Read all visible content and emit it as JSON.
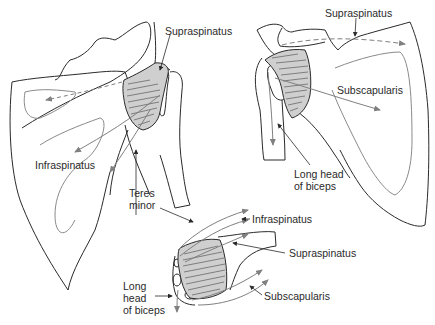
{
  "figure": {
    "views": [
      {
        "id": "posterior-view",
        "description": "Posterior view of scapula with rotator cuff"
      },
      {
        "id": "anterior-view",
        "description": "Anterior view of scapula with rotator cuff"
      },
      {
        "id": "superior-view",
        "description": "Superior view of humeral head with rotator cuff"
      }
    ],
    "colors": {
      "outline": "#2a2a2a",
      "muscle_fill": "#cfcfcf",
      "arrow": "#808080",
      "background": "#ffffff"
    }
  },
  "labels": {
    "posterior": {
      "supraspinatus": "Supraspinatus",
      "infraspinatus": "Infraspinatus",
      "teres_minor": "Teres\nminor"
    },
    "anterior": {
      "supraspinatus": "Supraspinatus",
      "subscapularis": "Subscapularis",
      "long_head_biceps": "Long head\nof biceps"
    },
    "superior": {
      "infraspinatus": "Infraspinatus",
      "supraspinatus": "Supraspinatus",
      "subscapularis": "Subscapularis",
      "long_head_biceps": "Long\nhead\nof biceps"
    }
  }
}
